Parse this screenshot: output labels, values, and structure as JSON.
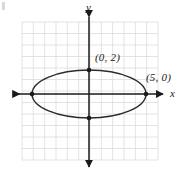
{
  "figure": {
    "width": 180,
    "height": 176,
    "background": "#ffffff",
    "corner_mark": ""
  },
  "axes": {
    "x_label": "x",
    "y_label": "y",
    "x_axis": {
      "y_px": 94,
      "x_start_px": 10,
      "x_end_px": 166,
      "arrows": "both"
    },
    "y_axis": {
      "x_px": 89,
      "y_start_px": 13,
      "y_end_px": 170,
      "arrows": "both"
    },
    "color": "#1a1a1a"
  },
  "grid": {
    "color": "#dcdcdc",
    "left_px": 22,
    "top_px": 22,
    "right_px": 158,
    "bottom_px": 160,
    "cell_px": 11.33,
    "visible": true
  },
  "chart_data": {
    "type": "scatter",
    "title": "",
    "xlabel": "x",
    "ylabel": "y",
    "grid": true,
    "legend": null,
    "origin_px": {
      "x": 89,
      "y": 94
    },
    "unit_px": {
      "x": 11.33,
      "y": 11.8
    },
    "curve": {
      "name": "ellipse",
      "equation": "x^2/25 + y^2/4 = 1",
      "center": [
        0,
        0
      ],
      "semi_major_a": 5,
      "semi_minor_b": 2,
      "orientation": "horizontal",
      "stroke": "#2b2b2b",
      "stroke_width": 1.4,
      "center_px": [
        89,
        94
      ],
      "rx_px": 57,
      "ry_px": 24
    },
    "points": [
      {
        "label": "(0, 2)",
        "x": 0,
        "y": 2,
        "px": [
          89,
          70
        ],
        "label_px": [
          95,
          52
        ],
        "marker": "dot"
      },
      {
        "label": "(5, 0)",
        "x": 5,
        "y": 0,
        "px": [
          146,
          94
        ],
        "label_px": [
          146,
          72
        ],
        "marker": "dot"
      },
      {
        "label": "",
        "x": 0,
        "y": -2,
        "px": [
          89,
          118
        ],
        "label_px": null,
        "marker": "dot"
      },
      {
        "label": "",
        "x": -5,
        "y": 0,
        "px": [
          32,
          94
        ],
        "label_px": null,
        "marker": "dot"
      }
    ],
    "marker_color": "#1a1a1a",
    "marker_radius_px": 2.3
  },
  "labels": {
    "point_top": "(0, 2)",
    "point_right": "(5, 0)",
    "axis_x": "x",
    "axis_y": "y"
  }
}
